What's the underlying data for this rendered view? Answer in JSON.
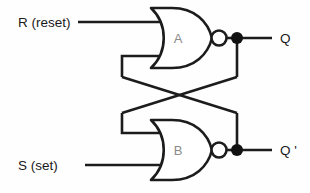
{
  "diagram": {
    "colors": {
      "wire": "#1c1c1c",
      "background": "#fefefe",
      "gate_label": "#8a8a8a",
      "io_label": "#1a1a1a",
      "junction": "#111111"
    },
    "inputs": [
      {
        "id": "reset",
        "label": "R (reset)"
      },
      {
        "id": "set",
        "label": "S (set)"
      }
    ],
    "gates": [
      {
        "id": "gate-a",
        "label": "A",
        "type": "NOR"
      },
      {
        "id": "gate-b",
        "label": "B",
        "type": "NOR"
      }
    ],
    "outputs": [
      {
        "id": "q",
        "label": "Q"
      },
      {
        "id": "q-not",
        "label": "Q '"
      }
    ]
  }
}
